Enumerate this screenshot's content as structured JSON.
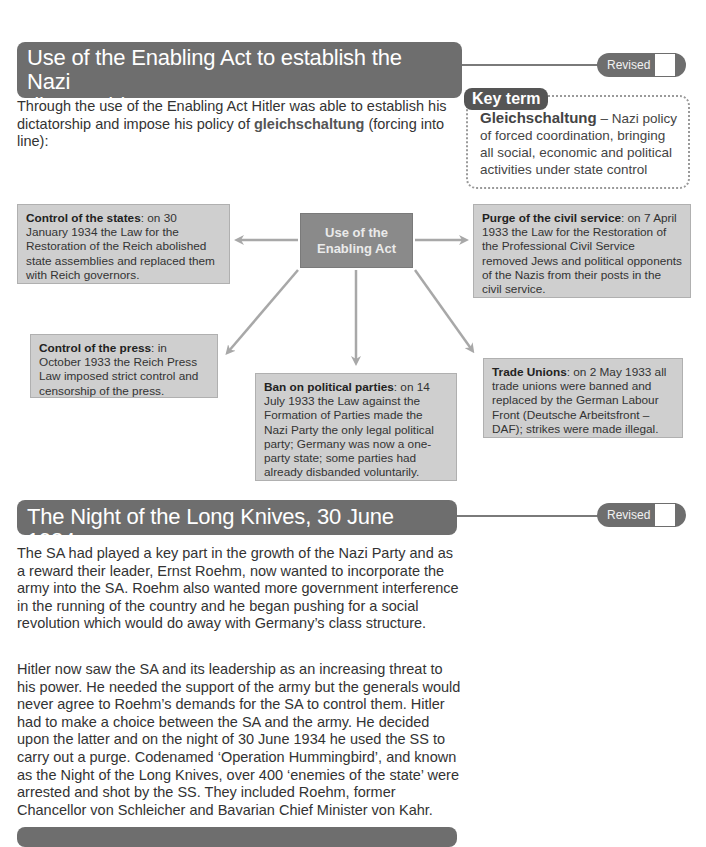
{
  "sections": [
    {
      "title": "Use of the Enabling Act to establish the Nazi dictatorship",
      "title_line1": "Use of the Enabling Act to establish the Nazi",
      "title_line2": "dictatorship",
      "revised_label": "Revised",
      "intro_pre": "Through the use of the Enabling Act Hitler was able to establish his dictatorship and impose his policy of ",
      "intro_term": "gleichschaltung",
      "intro_post": " (forcing into line):"
    },
    {
      "title": "The Night of the Long Knives, 30 June 1934",
      "revised_label": "Revised",
      "paragraphs": [
        "The SA had played a key part in the growth of the Nazi Party and as a reward their leader, Ernst Roehm, now wanted to incorporate the army into the SA. Roehm also wanted more government interference in the running of the country and he began pushing for a social revolution which would do away with Germany’s class structure.",
        "Hitler now saw the SA and its leadership as an increasing threat to his power. He needed the support of the army but the generals would never agree to Roehm’s demands for the SA to control them. Hitler had to make a choice between the SA and the army. He decided upon the latter and on the night of 30 June 1934 he used the SS to carry out a purge. Codenamed ‘Operation Hummingbird’, and known as the Night of the Long Knives, over 400 ‘enemies of the state’ were arrested and shot by the SS. They included Roehm, former Chancellor von Schleicher and Bavarian Chief Minister von Kahr."
      ]
    }
  ],
  "key_term": {
    "badge": "Key term",
    "term": "Gleichschaltung",
    "definition": " – Nazi policy of forced coordination, bringing all social, economic and political activities under state control"
  },
  "diagram": {
    "center": "Use of the Enabling Act",
    "center_line1": "Use of the",
    "center_line2": "Enabling Act",
    "boxes": [
      {
        "id": "states",
        "heading": "Control of the states",
        "text": ": on 30 January 1934 the Law for the Restoration of the Reich abolished state assemblies and replaced them with Reich governors."
      },
      {
        "id": "civil-service",
        "heading": "Purge of the civil service",
        "text": ": on 7 April 1933 the Law for the Restoration of the Professional Civil Service removed Jews and political opponents of the Nazis from their posts in the civil service."
      },
      {
        "id": "press",
        "heading": "Control of the press",
        "text": ": in October 1933 the Reich Press Law imposed strict control and censorship of the press."
      },
      {
        "id": "parties",
        "heading": "Ban on political parties",
        "text": ": on 14 July 1933 the Law against the Formation of Parties made the Nazi Party the only legal political party; Germany was now a one-party state; some parties had already disbanded voluntarily."
      },
      {
        "id": "unions",
        "heading": "Trade Unions",
        "text": ": on 2 May 1933 all trade unions were banned and replaced by the German Labour Front (Deutsche Arbeitsfront – DAF); strikes were made illegal."
      }
    ]
  },
  "colors": {
    "header_bg": "#6e6e6e",
    "box_bg": "#cfcfcf",
    "center_bg": "#8a8a8a",
    "arrow": "#a8a8a8"
  }
}
